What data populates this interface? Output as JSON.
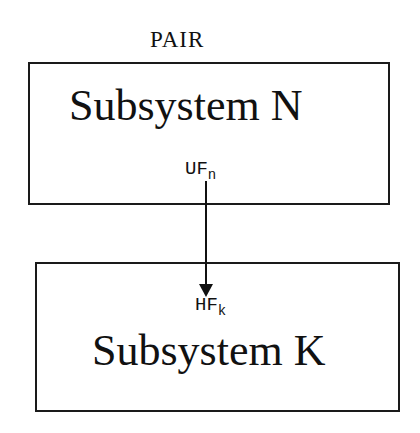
{
  "diagram": {
    "group_label": "PAIR",
    "source": {
      "title": "Subsystem N",
      "port_base": "UF",
      "port_sub": "n"
    },
    "target": {
      "title": "Subsystem K",
      "port_base": "HF",
      "port_sub": "k"
    },
    "edge": {
      "from": "UF_n",
      "to": "HF_k",
      "style": "solid arrow",
      "color": "#111111"
    }
  }
}
